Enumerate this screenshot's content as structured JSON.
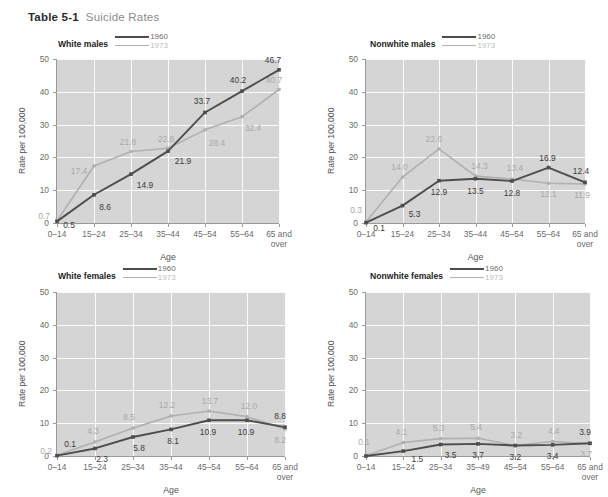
{
  "figure": {
    "table_number": "Table 5-1",
    "caption": "Suicide Rates"
  },
  "legend": {
    "series_1_label": "1960",
    "series_2_label": "1973",
    "series_1_color": "#4d4d4d",
    "series_2_color": "#b0b0b0"
  },
  "axes": {
    "ylabel": "Rate per 100,000",
    "xlabel": "Age",
    "ytick_labels": [
      "50",
      "40",
      "30",
      "20",
      "10",
      "0"
    ],
    "ytick_values": [
      50,
      40,
      30,
      20,
      10,
      0
    ],
    "ylim": [
      0,
      50
    ],
    "grid": true,
    "plot_background": "#d5d5d5",
    "gridline_color": "#fbfbfb"
  },
  "panels": [
    {
      "id": "white-males",
      "title": "White males"
    },
    {
      "id": "nonwhite-males",
      "title": "Nonwhite males"
    },
    {
      "id": "white-females",
      "title": "White females"
    },
    {
      "id": "nonwhite-females",
      "title": "Nonwhite females"
    }
  ],
  "chart_data": [
    {
      "type": "line",
      "title": "White males",
      "xlabel": "Age",
      "ylabel": "Rate per 100,000",
      "ylim": [
        0,
        50
      ],
      "grid": true,
      "legend_position": "top",
      "categories": [
        "0–14",
        "15–24",
        "25–34",
        "35–44",
        "45–54",
        "55–64",
        "65 and over"
      ],
      "category_lines": [
        [
          "0–14"
        ],
        [
          "15–24"
        ],
        [
          "25–34"
        ],
        [
          "35–44"
        ],
        [
          "45–54"
        ],
        [
          "55–64"
        ],
        [
          "65 and",
          "over"
        ]
      ],
      "series": [
        {
          "name": "1960",
          "color": "#4d4d4d",
          "values": [
            0.5,
            8.6,
            14.9,
            21.9,
            33.7,
            40.2,
            46.7
          ]
        },
        {
          "name": "1973",
          "color": "#b0b0b0",
          "values": [
            0.7,
            17.4,
            21.8,
            22.8,
            28.4,
            32.4,
            40.7
          ]
        }
      ]
    },
    {
      "type": "line",
      "title": "Nonwhite males",
      "xlabel": "Age",
      "ylabel": "Rate per 100,000",
      "ylim": [
        0,
        50
      ],
      "grid": true,
      "legend_position": "top",
      "categories": [
        "0–14",
        "15–24",
        "25–34",
        "35–44",
        "45–54",
        "55–64",
        "65 and over"
      ],
      "category_lines": [
        [
          "0–14"
        ],
        [
          "15–24"
        ],
        [
          "25–34"
        ],
        [
          "35–44"
        ],
        [
          "45–54"
        ],
        [
          "55–64"
        ],
        [
          "65 and",
          "over"
        ]
      ],
      "series": [
        {
          "name": "1960",
          "color": "#4d4d4d",
          "values": [
            0.1,
            5.3,
            12.9,
            13.5,
            12.8,
            16.9,
            12.4
          ]
        },
        {
          "name": "1973",
          "color": "#b0b0b0",
          "values": [
            0.3,
            14.0,
            22.6,
            14.3,
            13.4,
            12.1,
            11.9
          ]
        }
      ]
    },
    {
      "type": "line",
      "title": "White females",
      "xlabel": "Age",
      "ylabel": "Rate per 100,000",
      "ylim": [
        0,
        50
      ],
      "grid": true,
      "legend_position": "top",
      "categories": [
        "0–14",
        "15–24",
        "25–34",
        "35–44",
        "45–54",
        "55–64",
        "65 and over"
      ],
      "category_lines": [
        [
          "0–14"
        ],
        [
          "15–24"
        ],
        [
          "25–34"
        ],
        [
          "35–44"
        ],
        [
          "45–54"
        ],
        [
          "55–64"
        ],
        [
          "65 and",
          "over"
        ]
      ],
      "series": [
        {
          "name": "1960",
          "color": "#4d4d4d",
          "values": [
            0.1,
            2.3,
            5.8,
            8.1,
            10.9,
            10.9,
            8.8
          ]
        },
        {
          "name": "1973",
          "color": "#b0b0b0",
          "values": [
            0.2,
            4.3,
            8.5,
            12.2,
            13.7,
            12.0,
            8.2
          ]
        }
      ]
    },
    {
      "type": "line",
      "title": "Nonwhite females",
      "xlabel": "Age",
      "ylabel": "Rate per 100,000",
      "ylim": [
        0,
        50
      ],
      "grid": true,
      "legend_position": "top",
      "categories": [
        "0–14",
        "15–24",
        "25–34",
        "35–49",
        "45–54",
        "55–64",
        "65 and over"
      ],
      "category_lines": [
        [
          "0–14"
        ],
        [
          "15–24"
        ],
        [
          "25–34"
        ],
        [
          "35–49"
        ],
        [
          "45–54"
        ],
        [
          "55–64"
        ],
        [
          "65 and",
          "over"
        ]
      ],
      "series": [
        {
          "name": "1960",
          "color": "#4d4d4d",
          "values": [
            0.0,
            1.5,
            3.5,
            3.7,
            3.2,
            3.4,
            3.9
          ]
        },
        {
          "name": "1973",
          "color": "#b0b0b0",
          "values": [
            0.1,
            4.1,
            5.3,
            5.4,
            3.2,
            4.4,
            3.7
          ]
        }
      ]
    }
  ],
  "data_labels": [
    [
      {
        "series": 1973,
        "cat": 0,
        "text": "0.7",
        "dx": -13,
        "dy": -5
      },
      {
        "series": 1960,
        "cat": 0,
        "text": "0.5",
        "dx": 12,
        "dy": 4
      },
      {
        "series": 1973,
        "cat": 1,
        "text": "17.4",
        "dx": -15,
        "dy": 5
      },
      {
        "series": 1960,
        "cat": 1,
        "text": "8.6",
        "dx": 11,
        "dy": 12
      },
      {
        "series": 1973,
        "cat": 2,
        "text": "21.8",
        "dx": -3,
        "dy": -9
      },
      {
        "series": 1960,
        "cat": 2,
        "text": "14.9",
        "dx": 14,
        "dy": 11
      },
      {
        "series": 1973,
        "cat": 3,
        "text": "22.8",
        "dx": -2,
        "dy": -9
      },
      {
        "series": 1960,
        "cat": 3,
        "text": "21.9",
        "dx": 15,
        "dy": 10
      },
      {
        "series": 1960,
        "cat": 4,
        "text": "33.7",
        "dx": -3,
        "dy": -11
      },
      {
        "series": 1973,
        "cat": 4,
        "text": "28.4",
        "dx": 12,
        "dy": 13
      },
      {
        "series": 1960,
        "cat": 5,
        "text": "40.2",
        "dx": -4,
        "dy": -11
      },
      {
        "series": 1973,
        "cat": 5,
        "text": "32.4",
        "dx": 11,
        "dy": 11
      },
      {
        "series": 1960,
        "cat": 6,
        "text": "46.7",
        "dx": -6,
        "dy": -10
      },
      {
        "series": 1973,
        "cat": 6,
        "text": "40.7",
        "dx": -5,
        "dy": -10
      }
    ],
    [
      {
        "series": 1973,
        "cat": 0,
        "text": "0.3",
        "dx": -10,
        "dy": -12
      },
      {
        "series": 1960,
        "cat": 0,
        "text": "0.1",
        "dx": 13,
        "dy": 5
      },
      {
        "series": 1973,
        "cat": 1,
        "text": "14.0",
        "dx": -3,
        "dy": -10
      },
      {
        "series": 1960,
        "cat": 1,
        "text": "5.3",
        "dx": 12,
        "dy": 8
      },
      {
        "series": 1973,
        "cat": 2,
        "text": "22.6",
        "dx": -5,
        "dy": -10
      },
      {
        "series": 1960,
        "cat": 2,
        "text": "12.9",
        "dx": 0,
        "dy": 11
      },
      {
        "series": 1973,
        "cat": 3,
        "text": "14.3",
        "dx": 4,
        "dy": -10
      },
      {
        "series": 1960,
        "cat": 3,
        "text": "13.5",
        "dx": 0,
        "dy": 12
      },
      {
        "series": 1973,
        "cat": 4,
        "text": "13.4",
        "dx": 3,
        "dy": -11
      },
      {
        "series": 1960,
        "cat": 4,
        "text": "12.8",
        "dx": 0,
        "dy": 12
      },
      {
        "series": 1960,
        "cat": 5,
        "text": "16.9",
        "dx": -1,
        "dy": -10
      },
      {
        "series": 1973,
        "cat": 5,
        "text": "12.1",
        "dx": 0,
        "dy": 11
      },
      {
        "series": 1960,
        "cat": 6,
        "text": "12.4",
        "dx": -4,
        "dy": -11
      },
      {
        "series": 1973,
        "cat": 6,
        "text": "11.9",
        "dx": -3,
        "dy": 11
      }
    ],
    [
      {
        "series": 1973,
        "cat": 0,
        "text": "0.2",
        "dx": -11,
        "dy": -4
      },
      {
        "series": 1960,
        "cat": 0,
        "text": "0.1",
        "dx": 13,
        "dy": -12
      },
      {
        "series": 1973,
        "cat": 1,
        "text": "4.3",
        "dx": -2,
        "dy": -11
      },
      {
        "series": 1960,
        "cat": 1,
        "text": "2.3",
        "dx": 7,
        "dy": 11
      },
      {
        "series": 1973,
        "cat": 2,
        "text": "8.5",
        "dx": -4,
        "dy": -11
      },
      {
        "series": 1960,
        "cat": 2,
        "text": "5.8",
        "dx": 6,
        "dy": 11
      },
      {
        "series": 1973,
        "cat": 3,
        "text": "12.2",
        "dx": -4,
        "dy": -11
      },
      {
        "series": 1960,
        "cat": 3,
        "text": "8.1",
        "dx": 2,
        "dy": 12
      },
      {
        "series": 1973,
        "cat": 4,
        "text": "13.7",
        "dx": 1,
        "dy": -10
      },
      {
        "series": 1960,
        "cat": 4,
        "text": "10.9",
        "dx": -1,
        "dy": 12
      },
      {
        "series": 1973,
        "cat": 5,
        "text": "12.0",
        "dx": 2,
        "dy": -11
      },
      {
        "series": 1960,
        "cat": 5,
        "text": "10.9",
        "dx": -1,
        "dy": 12
      },
      {
        "series": 1960,
        "cat": 6,
        "text": "8.8",
        "dx": -5,
        "dy": -11
      },
      {
        "series": 1973,
        "cat": 6,
        "text": "8.2",
        "dx": -5,
        "dy": 11
      }
    ],
    [
      {
        "series": 1973,
        "cat": 0,
        "text": "0.1",
        "dx": -2,
        "dy": -14
      },
      {
        "series": 1973,
        "cat": 1,
        "text": "4.1",
        "dx": -2,
        "dy": -11
      },
      {
        "series": 1960,
        "cat": 1,
        "text": "1.5",
        "dx": 14,
        "dy": 8
      },
      {
        "series": 1973,
        "cat": 2,
        "text": "5.3",
        "dx": -2,
        "dy": -11
      },
      {
        "series": 1960,
        "cat": 2,
        "text": "3.5",
        "dx": 10,
        "dy": 10
      },
      {
        "series": 1973,
        "cat": 3,
        "text": "5.4",
        "dx": -2,
        "dy": -11
      },
      {
        "series": 1960,
        "cat": 3,
        "text": "3.7",
        "dx": 0,
        "dy": 11
      },
      {
        "series": 1973,
        "cat": 4,
        "text": "3.2",
        "dx": 1,
        "dy": -11
      },
      {
        "series": 1960,
        "cat": 4,
        "text": "3.2",
        "dx": 0,
        "dy": 11
      },
      {
        "series": 1973,
        "cat": 5,
        "text": "4.4",
        "dx": 1,
        "dy": -11
      },
      {
        "series": 1960,
        "cat": 5,
        "text": "3.4",
        "dx": 0,
        "dy": 11
      },
      {
        "series": 1960,
        "cat": 6,
        "text": "3.9",
        "dx": -5,
        "dy": -11
      },
      {
        "series": 1973,
        "cat": 6,
        "text": "3.7",
        "dx": -4,
        "dy": 10
      }
    ]
  ]
}
